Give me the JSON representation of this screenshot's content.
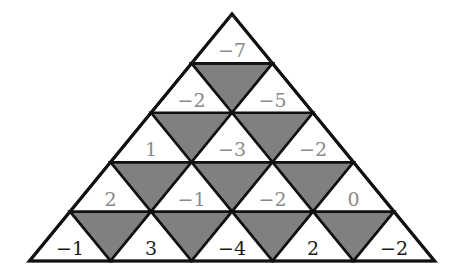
{
  "figure": {
    "name": "numbered-triangle-grid",
    "type": "triangular-lattice",
    "rows": 5,
    "colors": {
      "shaded_cell": "#808080",
      "unshaded_cell": "#ffffff",
      "edge": "#111111",
      "label_upper_rows": "#8a8a8a",
      "label_bottom_row": "#1a1a1a"
    },
    "geometry": {
      "apex_x": 232,
      "apex_y": 14,
      "bottom_left_x": 30,
      "bottom_right_x": 435,
      "bottom_y": 261,
      "row_height": 49.4,
      "half_width": 40.5
    },
    "rows_data": [
      {
        "index": 1,
        "up_labels": [
          "−7"
        ],
        "down_labels": [],
        "down_shaded": []
      },
      {
        "index": 2,
        "up_labels": [
          "−2",
          "−5"
        ],
        "down_labels": [
          "",
          ""
        ],
        "down_shaded": [
          true
        ]
      },
      {
        "index": 3,
        "up_labels": [
          "1",
          "−3",
          "−2"
        ],
        "down_labels": [
          "",
          ""
        ],
        "down_shaded": [
          true,
          true
        ]
      },
      {
        "index": 4,
        "up_labels": [
          "2",
          "−1",
          "−2",
          "0"
        ],
        "down_labels": [
          "",
          "",
          ""
        ],
        "down_shaded": [
          true,
          true,
          true
        ]
      },
      {
        "index": 5,
        "up_labels": [
          "−1",
          "3",
          "−4",
          "2",
          "−2"
        ],
        "down_labels": [
          "",
          "",
          "",
          ""
        ],
        "down_shaded": [
          true,
          true,
          true,
          true
        ]
      }
    ],
    "all_values_flat": [
      "−7",
      "−2",
      "−5",
      "1",
      "−3",
      "−2",
      "2",
      "−1",
      "−2",
      "0",
      "−1",
      "3",
      "−4",
      "2",
      "−2"
    ]
  }
}
